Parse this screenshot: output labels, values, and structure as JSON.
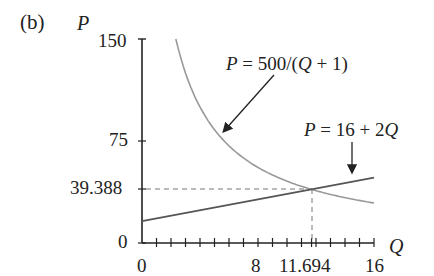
{
  "panel_label": "(b)",
  "chart_data": {
    "type": "line",
    "title": "",
    "xlabel": "Q",
    "ylabel": "P",
    "xlim": [
      0,
      16
    ],
    "ylim": [
      0,
      150
    ],
    "grid": false,
    "x_tick_labels": [
      "0",
      "8",
      "11.694",
      "16"
    ],
    "x_minor_ticks": [
      1,
      2,
      3,
      4,
      5,
      6,
      7,
      8,
      9,
      10,
      11,
      12,
      13,
      14,
      15,
      16
    ],
    "y_tick_labels": [
      "0",
      "39.388",
      "75",
      "150"
    ],
    "series": [
      {
        "name": "P = 500/(Q + 1)",
        "formula": "500/(Q+1)",
        "color": "#999999",
        "x_range": [
          2.333,
          16
        ],
        "x": [
          2.333,
          3,
          4,
          5,
          6,
          8,
          10,
          11.694,
          14,
          16
        ],
        "values": [
          150,
          125,
          100,
          83.3,
          71.4,
          55.6,
          45.5,
          39.388,
          33.3,
          29.4
        ]
      },
      {
        "name": "P = 16 + 2Q",
        "formula": "16+2Q",
        "color": "#555555",
        "x_range": [
          0,
          16
        ],
        "x": [
          0,
          8,
          11.694,
          16
        ],
        "values": [
          16,
          32,
          39.388,
          48
        ]
      }
    ],
    "annotations": [
      {
        "text": "P = 500/(Q + 1)",
        "arrow_to_series": 0
      },
      {
        "text": "P = 16 + 2Q",
        "arrow_to_series": 1
      },
      {
        "text": "intersection",
        "x": 11.694,
        "y": 39.388,
        "dashed_guides": true
      }
    ]
  },
  "labels": {
    "p_axis": "P",
    "q_axis": "Q",
    "y150": "150",
    "y75": "75",
    "y39": "39.388",
    "y0": "0",
    "x0": "0",
    "x8": "8",
    "x11": "11.694",
    "x16": "16",
    "curve1_pre": "P",
    "curve1_post": " = 500/(",
    "curve1_q": "Q",
    "curve1_end": " + 1)",
    "curve2_pre": "P",
    "curve2_post": " = 16 + 2",
    "curve2_q": "Q"
  }
}
